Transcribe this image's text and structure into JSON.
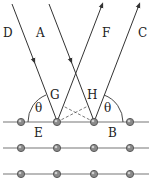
{
  "diagram": {
    "rays": {
      "incident": [
        {
          "label": "D",
          "from": [
            12,
            4
          ],
          "to": [
            57,
            122
          ]
        },
        {
          "label": "A",
          "from": [
            49,
            4
          ],
          "to": [
            94,
            122
          ]
        }
      ],
      "reflected": [
        {
          "label": "F",
          "from": [
            57,
            122
          ],
          "to": [
            102,
            4
          ]
        },
        {
          "label": "C",
          "from": [
            94,
            122
          ],
          "to": [
            139,
            4
          ]
        }
      ]
    },
    "points": {
      "G": "G",
      "H": "H",
      "E": "E",
      "B": "B"
    },
    "angle_label": "θ",
    "planes_y": [
      122,
      148,
      174
    ],
    "atoms_x": [
      21,
      57,
      94,
      130
    ],
    "colors": {
      "ray": "#333333",
      "plane": "#777777",
      "atom": "#8a8a8a"
    }
  }
}
